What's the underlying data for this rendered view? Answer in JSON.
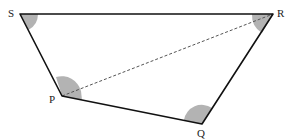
{
  "diagram": {
    "type": "quadrilateral",
    "vertices": [
      {
        "id": "S",
        "label": "S"
      },
      {
        "id": "R",
        "label": "R"
      },
      {
        "id": "Q",
        "label": "Q"
      },
      {
        "id": "P",
        "label": "P"
      }
    ],
    "sides": [
      "SR",
      "RQ",
      "QP",
      "PS"
    ],
    "diagonals": [
      {
        "from": "P",
        "to": "R",
        "style": "dashed"
      }
    ],
    "marked_angles": [
      "S",
      "R",
      "P",
      "Q"
    ],
    "colors": {
      "stroke": "#111111",
      "angle_fill": "#b3b3b3",
      "diagonal": "#555555"
    }
  }
}
